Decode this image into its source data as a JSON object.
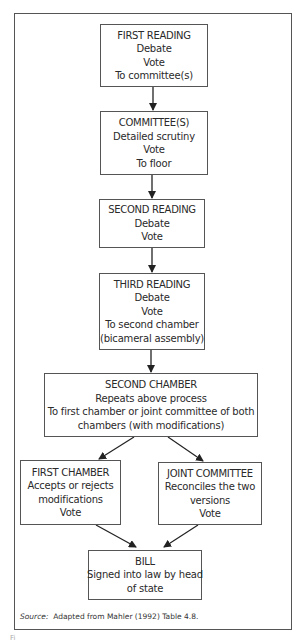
{
  "diagram": {
    "type": "flowchart",
    "nodes": [
      {
        "id": "first-reading",
        "lines": [
          "FIRST READING",
          "Debate",
          "Vote",
          "To committee(s)"
        ]
      },
      {
        "id": "committees",
        "lines": [
          "COMMITTEE(S)",
          "Detailed scrutiny",
          "Vote",
          "To floor"
        ]
      },
      {
        "id": "second-reading",
        "lines": [
          "SECOND READING",
          "Debate",
          "Vote"
        ]
      },
      {
        "id": "third-reading",
        "lines": [
          "THIRD READING",
          "Debate",
          "Vote",
          "To second chamber",
          "(bicameral assembly)"
        ]
      },
      {
        "id": "second-chamber",
        "lines": [
          "SECOND CHAMBER",
          "Repeats above process",
          "To first chamber or joint committee of both",
          "chambers (with modifications)"
        ]
      },
      {
        "id": "first-chamber",
        "lines": [
          "FIRST CHAMBER",
          "Accepts or rejects",
          "modifications",
          "Vote"
        ]
      },
      {
        "id": "joint-committee",
        "lines": [
          "JOINT COMMITTEE",
          "Reconciles the two",
          "versions",
          "Vote"
        ]
      },
      {
        "id": "bill",
        "lines": [
          "BILL",
          "Signed into law by head",
          "of state"
        ]
      }
    ],
    "edges": [
      {
        "from": "first-reading",
        "to": "committees"
      },
      {
        "from": "committees",
        "to": "second-reading"
      },
      {
        "from": "second-reading",
        "to": "third-reading"
      },
      {
        "from": "third-reading",
        "to": "second-chamber"
      },
      {
        "from": "second-chamber",
        "to": "first-chamber"
      },
      {
        "from": "second-chamber",
        "to": "joint-committee"
      },
      {
        "from": "first-chamber",
        "to": "bill"
      },
      {
        "from": "joint-committee",
        "to": "bill"
      }
    ]
  },
  "source": {
    "label": "Source:",
    "text": "Adapted from Mahler (1992) Table 4.8."
  },
  "figure_label": "Fi"
}
